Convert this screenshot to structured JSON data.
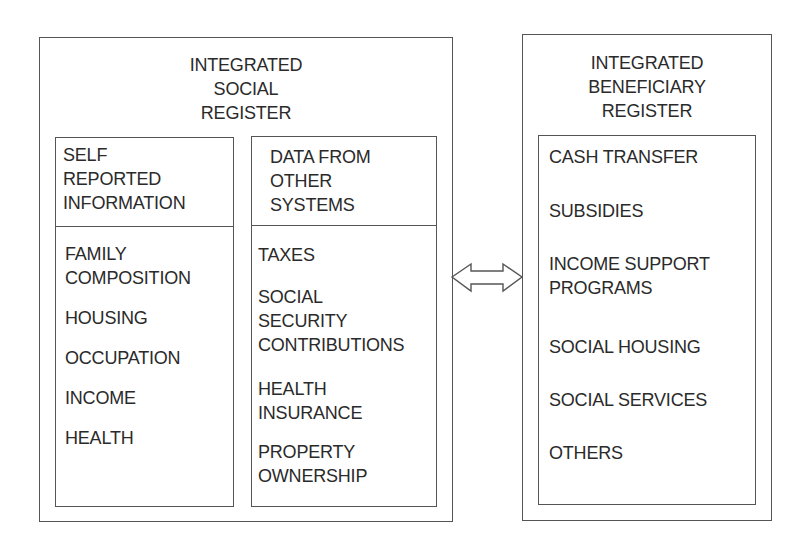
{
  "integrated_social_register": {
    "title_lines": [
      "INTEGRATED",
      "SOCIAL",
      "REGISTER"
    ],
    "self_reported": {
      "header_lines": [
        "SELF",
        "REPORTED",
        "INFORMATION"
      ],
      "items": [
        {
          "lines": [
            "FAMILY",
            "COMPOSITION"
          ]
        },
        {
          "lines": [
            "HOUSING"
          ]
        },
        {
          "lines": [
            "OCCUPATION"
          ]
        },
        {
          "lines": [
            "INCOME"
          ]
        },
        {
          "lines": [
            "HEALTH"
          ]
        }
      ]
    },
    "other_systems": {
      "header_lines": [
        "DATA FROM",
        "OTHER",
        "SYSTEMS"
      ],
      "items": [
        {
          "lines": [
            "TAXES"
          ]
        },
        {
          "lines": [
            "SOCIAL",
            "SECURITY",
            "CONTRIBUTIONS"
          ]
        },
        {
          "lines": [
            "HEALTH",
            "INSURANCE"
          ]
        },
        {
          "lines": [
            "PROPERTY",
            "OWNERSHIP"
          ]
        }
      ]
    }
  },
  "connector": {
    "icon": "double-arrow-icon",
    "direction": "bidirectional"
  },
  "integrated_beneficiary_register": {
    "title_lines": [
      "INTEGRATED",
      "BENEFICIARY",
      "REGISTER"
    ],
    "items": [
      {
        "lines": [
          "CASH TRANSFER"
        ]
      },
      {
        "lines": [
          "SUBSIDIES"
        ]
      },
      {
        "lines": [
          "INCOME SUPPORT",
          "PROGRAMS"
        ]
      },
      {
        "lines": [
          "SOCIAL HOUSING"
        ]
      },
      {
        "lines": [
          "SOCIAL SERVICES"
        ]
      },
      {
        "lines": [
          "OTHERS"
        ]
      }
    ]
  },
  "colors": {
    "line": "#555555",
    "text": "#2a2a2a",
    "background": "#ffffff"
  }
}
